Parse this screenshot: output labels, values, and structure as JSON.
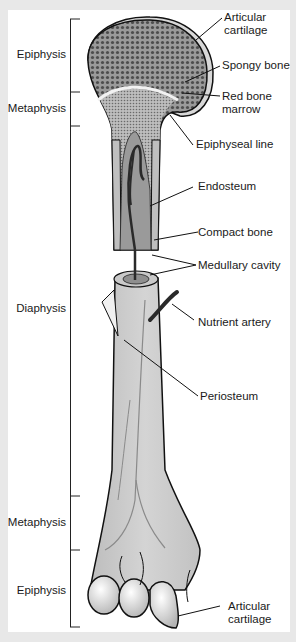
{
  "figure": {
    "regions": [
      {
        "label": "Epiphysis",
        "top": 18,
        "bottom": 92
      },
      {
        "label": "Metaphysis",
        "top": 92,
        "bottom": 126
      },
      {
        "label": "Diaphysis",
        "top": 126,
        "bottom": 496
      },
      {
        "label": "Metaphysis",
        "top": 496,
        "bottom": 550
      },
      {
        "label": "Epiphysis",
        "top": 550,
        "bottom": 628
      }
    ],
    "labels": [
      {
        "text": "Articular\ncartilage",
        "line1": "Articular",
        "line2": "cartilage"
      },
      {
        "text": "Spongy bone"
      },
      {
        "text": "Red bone\nmarrow",
        "line1": "Red bone",
        "line2": "marrow"
      },
      {
        "text": "Epiphyseal line"
      },
      {
        "text": "Endosteum"
      },
      {
        "text": "Compact bone"
      },
      {
        "text": "Medullary cavity"
      },
      {
        "text": "Nutrient artery"
      },
      {
        "text": "Periosteum"
      },
      {
        "text": "Articular\ncartilage",
        "line1": "Articular",
        "line2": "cartilage"
      }
    ]
  },
  "colors": {
    "frame": "#e8e8e8",
    "panel": "#ffffff",
    "bone": "#c9c9c9",
    "spongy": "#8a8a8a",
    "outline": "#111111",
    "cartilage": "#d8d8d8",
    "cavity": "#a9a9a9",
    "vessel": "#333333"
  }
}
